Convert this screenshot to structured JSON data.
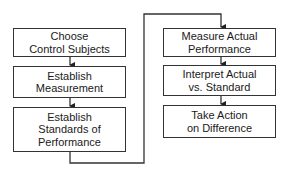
{
  "diagram": {
    "type": "flowchart",
    "left_column": [
      {
        "id": "choose",
        "lines": [
          "Choose",
          "Control Subjects"
        ]
      },
      {
        "id": "establish-measurement",
        "lines": [
          "Establish",
          "Measurement"
        ]
      },
      {
        "id": "establish-standards",
        "lines": [
          "Establish",
          "Standards of",
          "Performance"
        ]
      }
    ],
    "right_column": [
      {
        "id": "measure",
        "lines": [
          "Measure Actual",
          "Performance"
        ]
      },
      {
        "id": "interpret",
        "lines": [
          "Interpret Actual",
          "vs. Standard"
        ]
      },
      {
        "id": "take-action",
        "lines": [
          "Take Action",
          "on Difference"
        ]
      }
    ],
    "edges": [
      [
        "choose",
        "establish-measurement"
      ],
      [
        "establish-measurement",
        "establish-standards"
      ],
      [
        "establish-standards",
        "measure"
      ],
      [
        "measure",
        "interpret"
      ],
      [
        "interpret",
        "take-action"
      ]
    ],
    "colors": {
      "line": "#333333",
      "background": "#ffffff"
    }
  }
}
